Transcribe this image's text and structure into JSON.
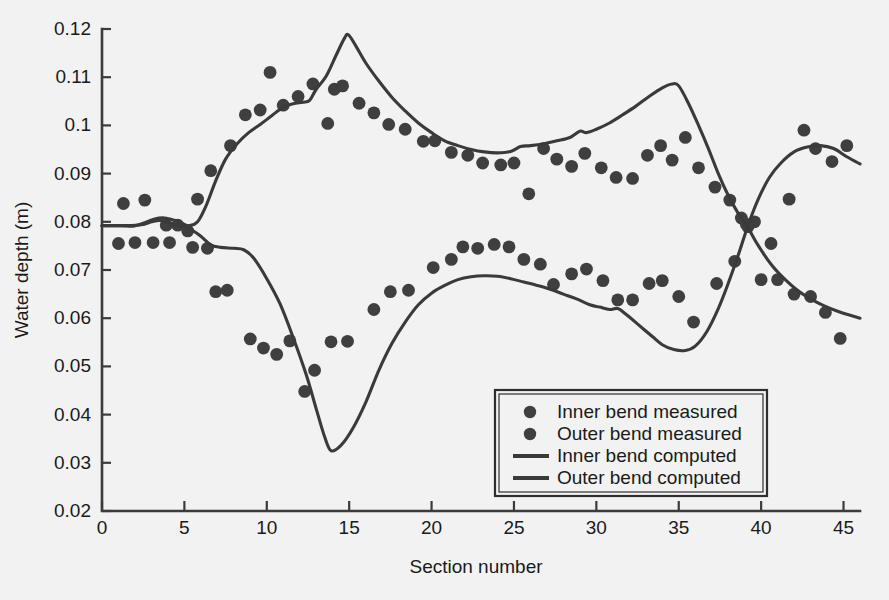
{
  "chart_data": {
    "type": "scatter",
    "title": "",
    "xlabel": "Section number",
    "ylabel": "Water depth (m)",
    "xlim": [
      0,
      46
    ],
    "ylim": [
      0.02,
      0.12
    ],
    "xticks": [
      0,
      5,
      10,
      15,
      20,
      25,
      30,
      35,
      40,
      45
    ],
    "xtick_labels": [
      "0",
      "5",
      "10",
      "15",
      "20",
      "25",
      "30",
      "35",
      "40",
      "45"
    ],
    "yticks": [
      0.02,
      0.03,
      0.04,
      0.05,
      0.06,
      0.07,
      0.08,
      0.09,
      0.1,
      0.11,
      0.12
    ],
    "ytick_labels": [
      "0.02",
      "0.03",
      "0.04",
      "0.05",
      "0.06",
      "0.07",
      "0.08",
      "0.09",
      "0.1",
      "0.11",
      "0.12"
    ],
    "grid": false,
    "legend_position": "lower-right",
    "marker_color": "#3f3f3f",
    "line_color": "#3a3a3a",
    "background_color": "#f2f2f2",
    "legend": [
      {
        "label": "Inner bend measured",
        "kind": "marker"
      },
      {
        "label": "Outer bend measured",
        "kind": "marker"
      },
      {
        "label": "Inner bend computed",
        "kind": "line"
      },
      {
        "label": "Outer bend computed",
        "kind": "line"
      }
    ],
    "series": [
      {
        "name": "Inner bend measured",
        "kind": "scatter",
        "points": [
          [
            1.0,
            0.0755
          ],
          [
            1.3,
            0.0838
          ],
          [
            2.6,
            0.0845
          ],
          [
            3.1,
            0.0757
          ],
          [
            4.1,
            0.0757
          ],
          [
            4.6,
            0.0793
          ],
          [
            5.2,
            0.0781
          ],
          [
            5.5,
            0.0747
          ],
          [
            6.4,
            0.0745
          ],
          [
            6.9,
            0.0655
          ],
          [
            7.6,
            0.0658
          ],
          [
            9.0,
            0.0557
          ],
          [
            9.8,
            0.0538
          ],
          [
            10.6,
            0.0525
          ],
          [
            11.4,
            0.0553
          ],
          [
            12.3,
            0.0448
          ],
          [
            12.9,
            0.0492
          ],
          [
            13.9,
            0.0551
          ],
          [
            14.9,
            0.0552
          ],
          [
            16.5,
            0.0618
          ],
          [
            17.5,
            0.0655
          ],
          [
            18.6,
            0.0658
          ],
          [
            20.1,
            0.0705
          ],
          [
            21.2,
            0.0722
          ],
          [
            21.9,
            0.0748
          ],
          [
            22.8,
            0.0745
          ],
          [
            23.8,
            0.0753
          ],
          [
            24.7,
            0.0748
          ],
          [
            25.6,
            0.0722
          ],
          [
            26.6,
            0.0712
          ],
          [
            27.4,
            0.067
          ],
          [
            28.5,
            0.0692
          ],
          [
            29.4,
            0.0702
          ],
          [
            30.4,
            0.0678
          ],
          [
            31.3,
            0.0638
          ],
          [
            32.2,
            0.0638
          ],
          [
            33.2,
            0.0672
          ],
          [
            34.0,
            0.0678
          ],
          [
            35.0,
            0.0645
          ],
          [
            35.9,
            0.0592
          ],
          [
            37.3,
            0.0672
          ],
          [
            38.4,
            0.0718
          ],
          [
            39.2,
            0.079
          ],
          [
            39.6,
            0.08
          ],
          [
            40.6,
            0.0755
          ],
          [
            41.7,
            0.0847
          ],
          [
            42.6,
            0.099
          ],
          [
            43.3,
            0.0952
          ],
          [
            44.3,
            0.0925
          ],
          [
            45.2,
            0.0958
          ]
        ]
      },
      {
        "name": "Outer bend measured",
        "kind": "scatter",
        "points": [
          [
            2.0,
            0.0757
          ],
          [
            3.9,
            0.0793
          ],
          [
            5.8,
            0.0847
          ],
          [
            6.6,
            0.0906
          ],
          [
            7.8,
            0.0958
          ],
          [
            8.7,
            0.1022
          ],
          [
            9.6,
            0.1032
          ],
          [
            10.2,
            0.111
          ],
          [
            11.0,
            0.1042
          ],
          [
            11.9,
            0.106
          ],
          [
            12.8,
            0.1086
          ],
          [
            13.7,
            0.1004
          ],
          [
            14.1,
            0.1075
          ],
          [
            14.6,
            0.1082
          ],
          [
            15.6,
            0.1046
          ],
          [
            16.5,
            0.1026
          ],
          [
            17.4,
            0.1002
          ],
          [
            18.4,
            0.0992
          ],
          [
            19.5,
            0.0967
          ],
          [
            20.2,
            0.0968
          ],
          [
            21.2,
            0.0944
          ],
          [
            22.2,
            0.0938
          ],
          [
            23.1,
            0.0922
          ],
          [
            24.2,
            0.0918
          ],
          [
            25.0,
            0.0922
          ],
          [
            25.9,
            0.0858
          ],
          [
            26.8,
            0.0952
          ],
          [
            27.6,
            0.093
          ],
          [
            28.5,
            0.0915
          ],
          [
            29.3,
            0.0942
          ],
          [
            30.3,
            0.0912
          ],
          [
            31.2,
            0.0892
          ],
          [
            32.2,
            0.089
          ],
          [
            33.1,
            0.0938
          ],
          [
            33.9,
            0.0958
          ],
          [
            34.6,
            0.0928
          ],
          [
            35.4,
            0.0975
          ],
          [
            36.2,
            0.0912
          ],
          [
            37.2,
            0.0872
          ],
          [
            38.1,
            0.0845
          ],
          [
            38.8,
            0.0808
          ],
          [
            39.1,
            0.0795
          ],
          [
            40.0,
            0.068
          ],
          [
            41.0,
            0.068
          ],
          [
            42.0,
            0.065
          ],
          [
            43.0,
            0.0645
          ],
          [
            43.9,
            0.0612
          ],
          [
            44.8,
            0.0558
          ]
        ]
      },
      {
        "name": "Inner bend computed",
        "kind": "line",
        "points": [
          [
            0.0,
            0.0792
          ],
          [
            1.5,
            0.0792
          ],
          [
            2.4,
            0.0794
          ],
          [
            3.0,
            0.08
          ],
          [
            3.5,
            0.0803
          ],
          [
            4.0,
            0.08
          ],
          [
            4.5,
            0.0793
          ],
          [
            5.0,
            0.079
          ],
          [
            5.5,
            0.0782
          ],
          [
            6.0,
            0.077
          ],
          [
            6.6,
            0.0752
          ],
          [
            7.2,
            0.0747
          ],
          [
            8.0,
            0.0745
          ],
          [
            8.6,
            0.0742
          ],
          [
            9.2,
            0.0725
          ],
          [
            10.0,
            0.0682
          ],
          [
            10.8,
            0.063
          ],
          [
            11.6,
            0.056
          ],
          [
            12.4,
            0.0482
          ],
          [
            13.0,
            0.0412
          ],
          [
            13.5,
            0.0355
          ],
          [
            13.9,
            0.0325
          ],
          [
            14.5,
            0.0336
          ],
          [
            15.2,
            0.037
          ],
          [
            16.0,
            0.0425
          ],
          [
            16.8,
            0.0492
          ],
          [
            17.6,
            0.0548
          ],
          [
            18.4,
            0.0592
          ],
          [
            19.2,
            0.0628
          ],
          [
            20.0,
            0.0652
          ],
          [
            20.8,
            0.0668
          ],
          [
            21.6,
            0.068
          ],
          [
            22.4,
            0.0686
          ],
          [
            23.2,
            0.0688
          ],
          [
            24.0,
            0.0687
          ],
          [
            24.8,
            0.0682
          ],
          [
            25.6,
            0.0675
          ],
          [
            26.4,
            0.0668
          ],
          [
            27.2,
            0.066
          ],
          [
            28.0,
            0.065
          ],
          [
            28.8,
            0.064
          ],
          [
            29.6,
            0.0628
          ],
          [
            30.2,
            0.0623
          ],
          [
            30.8,
            0.0618
          ],
          [
            31.3,
            0.062
          ],
          [
            31.8,
            0.0608
          ],
          [
            32.6,
            0.0585
          ],
          [
            33.4,
            0.0562
          ],
          [
            34.0,
            0.0545
          ],
          [
            34.7,
            0.0535
          ],
          [
            35.4,
            0.0533
          ],
          [
            36.0,
            0.0542
          ],
          [
            36.7,
            0.0572
          ],
          [
            37.4,
            0.062
          ],
          [
            38.0,
            0.0672
          ],
          [
            38.6,
            0.073
          ],
          [
            39.2,
            0.0792
          ],
          [
            39.8,
            0.0845
          ],
          [
            40.5,
            0.0892
          ],
          [
            41.2,
            0.0922
          ],
          [
            42.0,
            0.0945
          ],
          [
            42.8,
            0.0955
          ],
          [
            43.6,
            0.0958
          ],
          [
            44.4,
            0.0952
          ],
          [
            45.2,
            0.0935
          ],
          [
            46.0,
            0.092
          ]
        ]
      },
      {
        "name": "Outer bend computed",
        "kind": "line",
        "points": [
          [
            0.0,
            0.0792
          ],
          [
            1.2,
            0.0792
          ],
          [
            1.9,
            0.0791
          ],
          [
            2.6,
            0.0798
          ],
          [
            3.2,
            0.0806
          ],
          [
            3.8,
            0.0808
          ],
          [
            4.4,
            0.0803
          ],
          [
            4.9,
            0.0796
          ],
          [
            5.3,
            0.0792
          ],
          [
            5.8,
            0.08
          ],
          [
            6.3,
            0.0832
          ],
          [
            6.9,
            0.0885
          ],
          [
            7.5,
            0.093
          ],
          [
            8.2,
            0.0962
          ],
          [
            8.9,
            0.0985
          ],
          [
            9.6,
            0.1002
          ],
          [
            10.3,
            0.102
          ],
          [
            11.0,
            0.1038
          ],
          [
            11.6,
            0.1045
          ],
          [
            12.2,
            0.1048
          ],
          [
            12.6,
            0.1052
          ],
          [
            13.0,
            0.1075
          ],
          [
            13.6,
            0.1102
          ],
          [
            14.2,
            0.1145
          ],
          [
            14.7,
            0.118
          ],
          [
            14.95,
            0.1188
          ],
          [
            15.4,
            0.1165
          ],
          [
            16.0,
            0.113
          ],
          [
            16.8,
            0.1092
          ],
          [
            17.6,
            0.1058
          ],
          [
            18.4,
            0.103
          ],
          [
            19.2,
            0.1005
          ],
          [
            20.0,
            0.0985
          ],
          [
            20.8,
            0.0968
          ],
          [
            21.6,
            0.0958
          ],
          [
            22.4,
            0.095
          ],
          [
            23.2,
            0.0945
          ],
          [
            24.0,
            0.0943
          ],
          [
            24.8,
            0.0946
          ],
          [
            25.4,
            0.0956
          ],
          [
            26.0,
            0.0958
          ],
          [
            26.8,
            0.0962
          ],
          [
            27.6,
            0.0968
          ],
          [
            28.4,
            0.0975
          ],
          [
            29.0,
            0.0988
          ],
          [
            29.4,
            0.0985
          ],
          [
            30.0,
            0.0992
          ],
          [
            30.8,
            0.1005
          ],
          [
            31.6,
            0.1022
          ],
          [
            32.4,
            0.104
          ],
          [
            33.2,
            0.106
          ],
          [
            34.0,
            0.1078
          ],
          [
            34.6,
            0.1086
          ],
          [
            35.0,
            0.1082
          ],
          [
            35.6,
            0.1045
          ],
          [
            36.2,
            0.1
          ],
          [
            36.8,
            0.0952
          ],
          [
            37.4,
            0.09
          ],
          [
            38.0,
            0.0855
          ],
          [
            38.6,
            0.0818
          ],
          [
            39.2,
            0.0788
          ],
          [
            39.8,
            0.0752
          ],
          [
            40.6,
            0.0712
          ],
          [
            41.4,
            0.0682
          ],
          [
            42.2,
            0.0658
          ],
          [
            43.0,
            0.064
          ],
          [
            43.8,
            0.0626
          ],
          [
            44.6,
            0.0615
          ],
          [
            45.4,
            0.0606
          ],
          [
            46.0,
            0.06
          ]
        ]
      }
    ]
  }
}
